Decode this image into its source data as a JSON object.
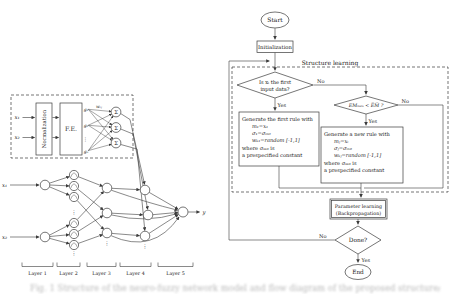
{
  "colors": {
    "background": "#ffffff",
    "line": "#3b3b3b",
    "text": "#1b1b1b"
  },
  "flowchart": {
    "start": "Start",
    "initialization": "Initialization",
    "structure_learning_label": "Structure learning",
    "labels": {
      "yes": "Yes",
      "no": "No"
    },
    "decision_first_input": {
      "line1": "Is xᵢ the first",
      "line2": "input data?"
    },
    "decision_error": "EMₘₐₓ < E̅M̅ ?",
    "first_rule_box": {
      "lines": [
        "Generate the first rule with",
        "m₁=x₁",
        "σ₁=σᵢₙᵢₜ",
        "wₖ₁=random [-1,1]",
        "where σᵢₙᵢₜ is",
        "a prespecified constant"
      ]
    },
    "new_rule_box": {
      "lines": [
        "Generate a new rule with",
        "mⱼ=xᵢ",
        "σⱼ=σᵢₙᵢₜ",
        "wₖⱼ=random [-1,1]",
        "where σᵢₙᵢₜ is",
        "a prespecified constant"
      ]
    },
    "parameter_learning": {
      "line1": "Parameter learning",
      "line2": "(Backpropagation)"
    },
    "done": "Done?",
    "end": "End"
  },
  "network": {
    "input1": "x₁",
    "input2": "x₂",
    "normalization": "Normalization",
    "feature_extraction": "F.E.",
    "fe_out1": "g₁",
    "fe_out2": "g₂",
    "fe_outn": "gₙ",
    "weight_label": "wᵢⱼ",
    "sum_symbol": "Σ",
    "output_label": "y",
    "dots": "⋮",
    "layer_labels": [
      "Layer 1",
      "Layer 2",
      "Layer 3",
      "Layer 4",
      "Layer 5"
    ]
  },
  "caption_fragment": "Fig. 1   Structure of the neuro-fuzzy network model and flow diagram of the proposed structure/parameter learning scheme"
}
